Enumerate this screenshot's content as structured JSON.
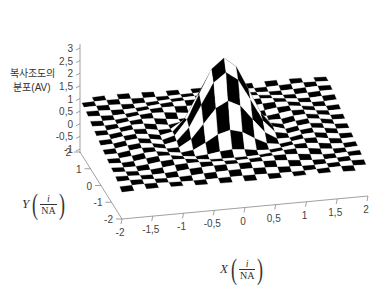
{
  "chart_data": {
    "type": "surface3d",
    "title": "",
    "zlabel": [
      "복사조도의",
      "분포(AV)"
    ],
    "xlabel": {
      "var": "X",
      "num": "i",
      "den": "NA"
    },
    "ylabel": {
      "var": "Y",
      "num": "i",
      "den": "NA"
    },
    "x_ticks": [
      "-2",
      "-1,5",
      "-1",
      "-0,5",
      "0",
      "0,5",
      "1",
      "1,5",
      "2"
    ],
    "y_ticks": [
      "-2",
      "-1",
      "0",
      "1",
      "2"
    ],
    "z_ticks": [
      "-1",
      "-0,5",
      "0",
      "0,5",
      "1",
      "1,5",
      "2",
      "2,5",
      "3"
    ],
    "xlim": [
      -2,
      2
    ],
    "ylim": [
      -2,
      2
    ],
    "zlim": [
      -1,
      3
    ],
    "surface": {
      "function": "Airy-like radiance distribution: peak at origin with side lobes",
      "peak_value": 3.0,
      "peak_location": [
        0,
        0
      ],
      "baseline": 0,
      "pattern": "black-white checkerboard mesh",
      "grid_cells": 20
    },
    "colors": {
      "dark": "#000000",
      "light": "#ffffff",
      "axis": "#888888"
    }
  }
}
